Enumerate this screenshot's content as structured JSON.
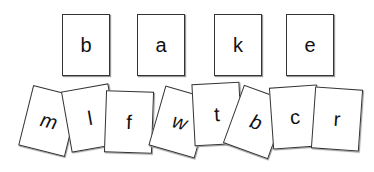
{
  "target_word": [
    "b",
    "a",
    "k",
    "e"
  ],
  "letter_cards": [
    {
      "letter": "m",
      "italic": true
    },
    {
      "letter": "l",
      "italic": false
    },
    {
      "letter": "f",
      "italic": false
    },
    {
      "letter": "w",
      "italic": true
    },
    {
      "letter": "t",
      "italic": false
    },
    {
      "letter": "b",
      "italic": true
    },
    {
      "letter": "c",
      "italic": false
    },
    {
      "letter": "r",
      "italic": false
    }
  ]
}
